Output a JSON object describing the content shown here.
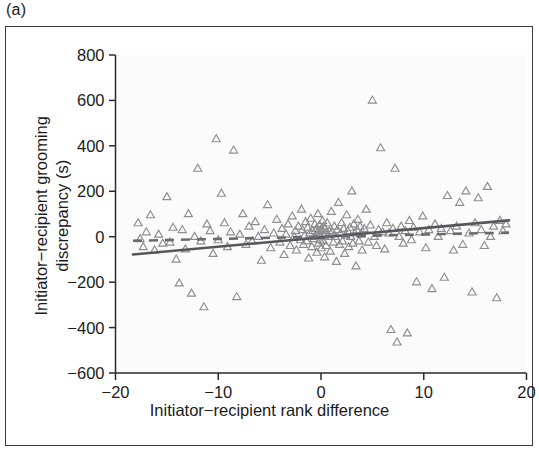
{
  "panel": {
    "label": "(a)"
  },
  "chart_data": {
    "type": "scatter",
    "title": "",
    "xlabel": "Initiator−recipient rank difference",
    "ylabel": "Initiator−recipient grooming\ndiscrepancy (s)",
    "ylabel_line1": "Initiator−recipient grooming",
    "ylabel_line2": "discrepancy (s)",
    "xlim": [
      -20,
      20
    ],
    "ylim": [
      -600,
      800
    ],
    "xticks": [
      -20,
      -10,
      0,
      10,
      20
    ],
    "xticklabels": [
      "−20",
      "−10",
      "0",
      "10",
      "20"
    ],
    "yticks": [
      -600,
      -400,
      -200,
      0,
      200,
      400,
      600,
      800
    ],
    "yticklabels": [
      "−600",
      "−400",
      "−200",
      "0",
      "200",
      "400",
      "600",
      "800"
    ],
    "grid": false,
    "legend": null,
    "marker": "triangle-up-open",
    "marker_color": "#8e8e90",
    "background_color": "#fbfbfb",
    "series": [
      {
        "name": "grooming discrepancy",
        "marker": "triangle-up-open",
        "points": [
          [
            -17.8,
            60
          ],
          [
            -17.6,
            -10
          ],
          [
            -17.3,
            -45
          ],
          [
            -17.0,
            20
          ],
          [
            -16.6,
            95
          ],
          [
            -16.2,
            -60
          ],
          [
            -15.8,
            10
          ],
          [
            -15.4,
            -30
          ],
          [
            -15.0,
            175
          ],
          [
            -14.7,
            -25
          ],
          [
            -14.4,
            40
          ],
          [
            -14.1,
            -100
          ],
          [
            -13.8,
            -205
          ],
          [
            -13.5,
            30
          ],
          [
            -13.2,
            -55
          ],
          [
            -12.9,
            100
          ],
          [
            -12.6,
            -250
          ],
          [
            -12.3,
            0
          ],
          [
            -12.0,
            300
          ],
          [
            -11.7,
            -20
          ],
          [
            -11.4,
            -310
          ],
          [
            -11.1,
            55
          ],
          [
            -10.8,
            25
          ],
          [
            -10.5,
            -75
          ],
          [
            -10.2,
            430
          ],
          [
            -10.0,
            -15
          ],
          [
            -9.7,
            190
          ],
          [
            -9.4,
            60
          ],
          [
            -9.1,
            -45
          ],
          [
            -8.8,
            20
          ],
          [
            -8.5,
            380
          ],
          [
            -8.2,
            -265
          ],
          [
            -7.9,
            10
          ],
          [
            -7.6,
            100
          ],
          [
            -7.3,
            -35
          ],
          [
            -7.0,
            45
          ],
          [
            -6.7,
            -20
          ],
          [
            -6.4,
            65
          ],
          [
            -6.1,
            0
          ],
          [
            -5.8,
            -105
          ],
          [
            -5.5,
            30
          ],
          [
            -5.2,
            140
          ],
          [
            -4.9,
            -50
          ],
          [
            -4.6,
            15
          ],
          [
            -4.3,
            75
          ],
          [
            -4.0,
            -25
          ],
          [
            -3.8,
            35
          ],
          [
            -3.6,
            -80
          ],
          [
            -3.4,
            10
          ],
          [
            -3.2,
            55
          ],
          [
            -3.0,
            -40
          ],
          [
            -2.8,
            90
          ],
          [
            -2.6,
            0
          ],
          [
            -2.5,
            25
          ],
          [
            -2.4,
            -60
          ],
          [
            -2.2,
            45
          ],
          [
            -2.0,
            -15
          ],
          [
            -1.9,
            120
          ],
          [
            -1.8,
            30
          ],
          [
            -1.7,
            -35
          ],
          [
            -1.6,
            5
          ],
          [
            -1.5,
            65
          ],
          [
            -1.4,
            -20
          ],
          [
            -1.3,
            40
          ],
          [
            -1.2,
            -95
          ],
          [
            -1.1,
            15
          ],
          [
            -1.0,
            80
          ],
          [
            -0.9,
            -45
          ],
          [
            -0.8,
            25
          ],
          [
            -0.7,
            -10
          ],
          [
            -0.6,
            55
          ],
          [
            -0.5,
            0
          ],
          [
            -0.45,
            35
          ],
          [
            -0.4,
            -70
          ],
          [
            -0.35,
            20
          ],
          [
            -0.3,
            100
          ],
          [
            -0.25,
            -30
          ],
          [
            -0.2,
            10
          ],
          [
            -0.15,
            50
          ],
          [
            -0.1,
            -15
          ],
          [
            -0.05,
            30
          ],
          [
            0.0,
            0
          ],
          [
            0.05,
            -50
          ],
          [
            0.1,
            25
          ],
          [
            0.15,
            70
          ],
          [
            0.2,
            -20
          ],
          [
            0.25,
            45
          ],
          [
            0.3,
            5
          ],
          [
            0.35,
            -90
          ],
          [
            0.4,
            35
          ],
          [
            0.45,
            15
          ],
          [
            0.5,
            -40
          ],
          [
            0.6,
            60
          ],
          [
            0.7,
            0
          ],
          [
            0.8,
            25
          ],
          [
            0.9,
            -65
          ],
          [
            1.0,
            110
          ],
          [
            1.1,
            20
          ],
          [
            1.2,
            -25
          ],
          [
            1.3,
            45
          ],
          [
            1.4,
            0
          ],
          [
            1.5,
            -110
          ],
          [
            1.6,
            30
          ],
          [
            1.7,
            150
          ],
          [
            1.8,
            -35
          ],
          [
            1.9,
            15
          ],
          [
            2.0,
            60
          ],
          [
            2.1,
            -20
          ],
          [
            2.2,
            35
          ],
          [
            2.3,
            -75
          ],
          [
            2.4,
            5
          ],
          [
            2.5,
            95
          ],
          [
            2.6,
            25
          ],
          [
            2.7,
            -45
          ],
          [
            2.8,
            40
          ],
          [
            2.9,
            0
          ],
          [
            3.0,
            200
          ],
          [
            3.1,
            -30
          ],
          [
            3.2,
            55
          ],
          [
            3.3,
            15
          ],
          [
            3.4,
            -130
          ],
          [
            3.5,
            30
          ],
          [
            3.6,
            75
          ],
          [
            3.7,
            -20
          ],
          [
            3.8,
            45
          ],
          [
            3.9,
            10
          ],
          [
            4.0,
            -60
          ],
          [
            4.2,
            35
          ],
          [
            4.4,
            120
          ],
          [
            4.6,
            -25
          ],
          [
            4.8,
            50
          ],
          [
            5.0,
            600
          ],
          [
            5.2,
            0
          ],
          [
            5.4,
            -40
          ],
          [
            5.6,
            30
          ],
          [
            5.8,
            390
          ],
          [
            6.0,
            20
          ],
          [
            6.2,
            -55
          ],
          [
            6.4,
            60
          ],
          [
            6.6,
            15
          ],
          [
            6.8,
            -410
          ],
          [
            7.0,
            35
          ],
          [
            7.2,
            300
          ],
          [
            7.4,
            -465
          ],
          [
            7.6,
            0
          ],
          [
            7.8,
            45
          ],
          [
            8.0,
            -30
          ],
          [
            8.2,
            25
          ],
          [
            8.4,
            -425
          ],
          [
            8.6,
            70
          ],
          [
            8.8,
            -15
          ],
          [
            9.0,
            40
          ],
          [
            9.3,
            -200
          ],
          [
            9.6,
            20
          ],
          [
            9.9,
            90
          ],
          [
            10.2,
            -50
          ],
          [
            10.5,
            30
          ],
          [
            10.8,
            -230
          ],
          [
            11.1,
            55
          ],
          [
            11.4,
            0
          ],
          [
            11.7,
            35
          ],
          [
            12.0,
            -180
          ],
          [
            12.3,
            180
          ],
          [
            12.6,
            25
          ],
          [
            12.9,
            -60
          ],
          [
            13.2,
            45
          ],
          [
            13.5,
            150
          ],
          [
            13.8,
            -35
          ],
          [
            14.1,
            200
          ],
          [
            14.4,
            15
          ],
          [
            14.7,
            -245
          ],
          [
            15.0,
            60
          ],
          [
            15.3,
            170
          ],
          [
            15.6,
            30
          ],
          [
            15.9,
            -40
          ],
          [
            16.2,
            220
          ],
          [
            16.5,
            0
          ],
          [
            16.8,
            45
          ],
          [
            17.1,
            -270
          ],
          [
            17.4,
            70
          ],
          [
            17.7,
            25
          ],
          [
            18.0,
            55
          ]
        ]
      }
    ],
    "fit_lines": [
      {
        "name": "solid-fit",
        "style": "solid",
        "color": "#55565a",
        "x_start": -18.3,
        "y_start": -78,
        "x_end": 18.3,
        "y_end": 72
      },
      {
        "name": "dashed-fit",
        "style": "dashed",
        "color": "#6a6b6f",
        "x_start": -18.3,
        "y_start": -18,
        "x_end": 18.3,
        "y_end": 18
      }
    ]
  }
}
